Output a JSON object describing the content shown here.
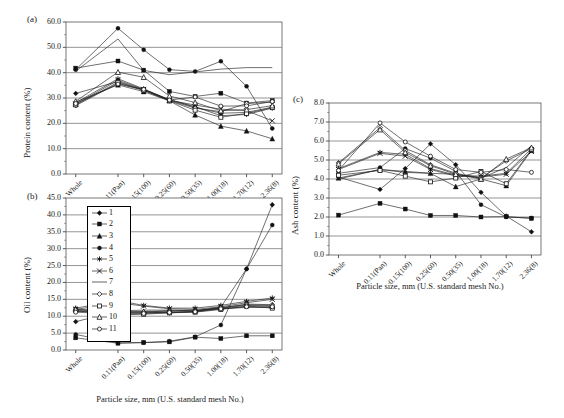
{
  "figure": {
    "panels": [
      "(a)",
      "(b)",
      "(c)"
    ],
    "xlabel": "Particle size, mm (U.S. standard mesh No.)",
    "categories": [
      "Whole",
      "0.11(Pan)",
      "0.15(100)",
      "0.25(60)",
      "0.50(35)",
      "1.00(18)",
      "1.70(12)",
      "2.36(8)"
    ]
  },
  "legend": {
    "items": [
      {
        "label": "1",
        "marker": "filled-diamond"
      },
      {
        "label": "2",
        "marker": "filled-square"
      },
      {
        "label": "3",
        "marker": "filled-triangle"
      },
      {
        "label": "4",
        "marker": "filled-circle"
      },
      {
        "label": "5",
        "marker": "asterisk"
      },
      {
        "label": "6",
        "marker": "cross-x"
      },
      {
        "label": "7",
        "marker": "line-only"
      },
      {
        "label": "8",
        "marker": "open-diamond"
      },
      {
        "label": "9",
        "marker": "open-square"
      },
      {
        "label": "10",
        "marker": "open-triangle"
      },
      {
        "label": "11",
        "marker": "open-circle"
      }
    ]
  },
  "chart_data": [
    {
      "id": "panel-a",
      "type": "line",
      "panel": "(a)",
      "title": "",
      "xlabel": "",
      "ylabel": "Protein content (%)",
      "ylim": [
        0.0,
        60.0
      ],
      "yticks": [
        "0.0",
        "10.0",
        "20.0",
        "30.0",
        "40.0",
        "50.0",
        "60.0"
      ],
      "grid": true,
      "legend_position": "none",
      "x": [
        "Whole",
        "0.11(Pan)",
        "0.15(100)",
        "0.25(60)",
        "0.50(35)",
        "1.00(18)",
        "1.70(12)",
        "2.36(8)"
      ],
      "series": [
        {
          "name": "1",
          "marker": "filled-diamond",
          "values": [
            31.8,
            36.5,
            33.2,
            29.4,
            26.3,
            24.0,
            24.3,
            26.4
          ]
        },
        {
          "name": "2",
          "marker": "filled-square",
          "values": [
            41.8,
            44.6,
            41.0,
            32.6,
            30.6,
            31.9,
            28.0,
            29.0
          ]
        },
        {
          "name": "3",
          "marker": "filled-triangle",
          "values": [
            28.4,
            35.2,
            32.5,
            28.9,
            23.3,
            18.9,
            17.0,
            13.9
          ]
        },
        {
          "name": "4",
          "marker": "filled-circle",
          "values": [
            41.2,
            57.5,
            49.0,
            41.2,
            40.5,
            44.5,
            34.6,
            18.0
          ]
        },
        {
          "name": "5",
          "marker": "asterisk",
          "values": [
            28.1,
            37.6,
            33.6,
            29.3,
            26.6,
            23.0,
            23.5,
            26.0
          ]
        },
        {
          "name": "6",
          "marker": "cross-x",
          "values": [
            27.6,
            37.0,
            33.4,
            29.1,
            27.2,
            25.6,
            25.0,
            21.0
          ]
        },
        {
          "name": "7",
          "marker": "line-only",
          "values": [
            40.6,
            53.3,
            40.9,
            39.2,
            40.3,
            41.4,
            42.0,
            42.0
          ]
        },
        {
          "name": "8",
          "marker": "open-diamond",
          "values": [
            27.0,
            35.8,
            33.0,
            29.0,
            26.0,
            24.6,
            27.8,
            28.4
          ]
        },
        {
          "name": "9",
          "marker": "open-square",
          "values": [
            27.3,
            36.2,
            33.1,
            28.9,
            25.2,
            22.4,
            23.9,
            26.2
          ]
        },
        {
          "name": "10",
          "marker": "open-triangle",
          "values": [
            28.7,
            40.2,
            38.2,
            30.8,
            28.2,
            25.0,
            25.4,
            27.0
          ]
        },
        {
          "name": "11",
          "marker": "open-circle",
          "values": [
            27.8,
            35.5,
            33.4,
            29.2,
            30.4,
            26.8,
            26.9,
            28.6
          ]
        }
      ]
    },
    {
      "id": "panel-b",
      "type": "line",
      "panel": "(b)",
      "title": "",
      "xlabel": "Particle size, mm (U.S. standard mesh No.)",
      "ylabel": "Oil content (%)",
      "ylim": [
        0.0,
        45.0
      ],
      "yticks": [
        "0.0",
        "5.0",
        "10.0",
        "15.0",
        "20.0",
        "25.0",
        "30.0",
        "35.0",
        "40.0",
        "45.0"
      ],
      "grid": true,
      "legend_position": "inside-left",
      "x": [
        "Whole",
        "0.11(Pan)",
        "0.15(100)",
        "0.25(60)",
        "0.50(35)",
        "1.00(18)",
        "1.70(12)",
        "2.36(8)"
      ],
      "series": [
        {
          "name": "1",
          "marker": "filled-diamond",
          "values": [
            8.4,
            11.5,
            11.2,
            11.0,
            11.4,
            12.7,
            24.0,
            43.0
          ]
        },
        {
          "name": "2",
          "marker": "filled-square",
          "values": [
            3.6,
            2.0,
            2.2,
            2.4,
            3.8,
            3.4,
            4.2,
            4.2
          ]
        },
        {
          "name": "3",
          "marker": "filled-triangle",
          "values": [
            12.2,
            11.0,
            11.2,
            11.6,
            11.8,
            12.4,
            13.2,
            13.0
          ]
        },
        {
          "name": "4",
          "marker": "filled-circle",
          "values": [
            4.6,
            2.1,
            2.2,
            2.6,
            3.9,
            7.4,
            24.0,
            37.0
          ]
        },
        {
          "name": "5",
          "marker": "asterisk",
          "values": [
            12.4,
            14.6,
            13.2,
            12.4,
            12.4,
            13.2,
            14.4,
            15.4
          ]
        },
        {
          "name": "6",
          "marker": "cross-x",
          "values": [
            12.0,
            14.0,
            13.0,
            12.2,
            12.0,
            12.8,
            14.0,
            15.0
          ]
        },
        {
          "name": "7",
          "marker": "line-only",
          "values": [
            11.4,
            11.6,
            11.8,
            11.8,
            11.6,
            12.2,
            12.6,
            12.6
          ]
        },
        {
          "name": "8",
          "marker": "open-diamond",
          "values": [
            11.8,
            10.8,
            11.0,
            11.2,
            11.4,
            12.4,
            13.6,
            13.4
          ]
        },
        {
          "name": "9",
          "marker": "open-square",
          "values": [
            11.6,
            10.4,
            10.6,
            11.0,
            11.2,
            12.0,
            13.0,
            12.4
          ]
        },
        {
          "name": "10",
          "marker": "open-triangle",
          "values": [
            12.0,
            11.2,
            11.4,
            11.5,
            11.6,
            12.6,
            13.4,
            13.2
          ]
        },
        {
          "name": "11",
          "marker": "open-circle",
          "values": [
            11.2,
            10.6,
            10.8,
            11.1,
            11.3,
            12.2,
            12.8,
            12.8
          ]
        }
      ]
    },
    {
      "id": "panel-c",
      "type": "line",
      "panel": "(c)",
      "title": "",
      "xlabel": "Particle size, mm (U.S. standard mesh No.)",
      "ylabel": "Ash content (%)",
      "ylim": [
        0.0,
        8.0
      ],
      "yticks": [
        "0.0",
        "1.0",
        "2.0",
        "3.0",
        "4.0",
        "5.0",
        "6.0",
        "7.0",
        "8.0"
      ],
      "grid": true,
      "legend_position": "none",
      "x": [
        "Whole",
        "0.11(Pan)",
        "0.15(100)",
        "0.25(60)",
        "0.50(35)",
        "1.00(18)",
        "1.70(12)",
        "2.36(8)"
      ],
      "series": [
        {
          "name": "1",
          "marker": "filled-diamond",
          "values": [
            4.1,
            3.45,
            4.55,
            5.85,
            4.75,
            3.3,
            2.05,
            1.22
          ]
        },
        {
          "name": "2",
          "marker": "filled-square",
          "values": [
            2.1,
            2.72,
            2.42,
            2.08,
            2.08,
            2.0,
            2.02,
            1.92
          ]
        },
        {
          "name": "3",
          "marker": "filled-triangle",
          "values": [
            4.05,
            4.5,
            4.4,
            4.3,
            3.6,
            4.0,
            3.65,
            5.5
          ]
        },
        {
          "name": "4",
          "marker": "filled-circle",
          "values": [
            4.3,
            4.6,
            5.6,
            5.1,
            4.4,
            2.65,
            2.0,
            1.95
          ]
        },
        {
          "name": "5",
          "marker": "asterisk",
          "values": [
            4.55,
            5.4,
            5.3,
            4.55,
            4.2,
            4.15,
            4.3,
            5.6
          ]
        },
        {
          "name": "6",
          "marker": "cross-x",
          "values": [
            4.5,
            5.35,
            5.2,
            4.5,
            4.15,
            4.1,
            4.25,
            5.45
          ]
        },
        {
          "name": "7",
          "marker": "line-only",
          "values": [
            4.0,
            4.5,
            4.35,
            4.3,
            4.25,
            4.05,
            4.6,
            5.75
          ]
        },
        {
          "name": "8",
          "marker": "open-diamond",
          "values": [
            4.85,
            6.7,
            5.5,
            4.75,
            4.3,
            4.05,
            4.95,
            5.6
          ]
        },
        {
          "name": "9",
          "marker": "open-square",
          "values": [
            4.2,
            4.45,
            4.15,
            3.85,
            4.05,
            4.4,
            3.75,
            5.55
          ]
        },
        {
          "name": "10",
          "marker": "open-triangle",
          "values": [
            4.8,
            6.6,
            5.4,
            4.7,
            4.25,
            4.0,
            5.05,
            5.65
          ]
        },
        {
          "name": "11",
          "marker": "open-circle",
          "values": [
            4.45,
            6.95,
            5.95,
            5.2,
            4.5,
            4.35,
            4.5,
            4.35
          ]
        }
      ]
    }
  ]
}
